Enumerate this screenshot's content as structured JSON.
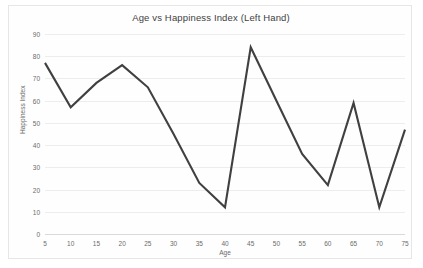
{
  "chart": {
    "title": "Age vs Happiness Index (Left Hand)",
    "xlabel": "Age",
    "ylabel": "Happiness Index",
    "line_color": "#404040",
    "grid_color": "#ededed",
    "frame_color": "#e6e6e6",
    "tick_color": "#6b6b6b"
  },
  "chart_data": {
    "type": "line",
    "title": "Age vs Happiness Index (Left Hand)",
    "xlabel": "Age",
    "ylabel": "Happiness Index",
    "xlim": [
      5,
      75
    ],
    "ylim": [
      0,
      90
    ],
    "ytick_labels": [
      "90",
      "80",
      "70",
      "60",
      "50",
      "40",
      "30",
      "20",
      "10",
      "0"
    ],
    "yticks": [
      90,
      80,
      70,
      60,
      50,
      40,
      30,
      20,
      10,
      0
    ],
    "xtick_labels": [
      "5",
      "10",
      "15",
      "20",
      "25",
      "30",
      "35",
      "40",
      "45",
      "50",
      "55",
      "60",
      "65",
      "70",
      "75"
    ],
    "xticks": [
      5,
      10,
      15,
      20,
      25,
      30,
      35,
      40,
      45,
      50,
      55,
      60,
      65,
      70,
      75
    ],
    "grid": "horizontal",
    "legend": "none",
    "x": [
      5,
      10,
      15,
      20,
      25,
      30,
      35,
      40,
      45,
      50,
      55,
      60,
      65,
      70,
      75
    ],
    "values": [
      77,
      57,
      68,
      76,
      66,
      45,
      23,
      12,
      84,
      60,
      36,
      22,
      59,
      12,
      47
    ],
    "series": [
      {
        "name": "Happiness Index",
        "values": [
          77,
          57,
          68,
          76,
          66,
          45,
          23,
          12,
          84,
          60,
          36,
          22,
          59,
          12,
          47
        ]
      }
    ]
  }
}
